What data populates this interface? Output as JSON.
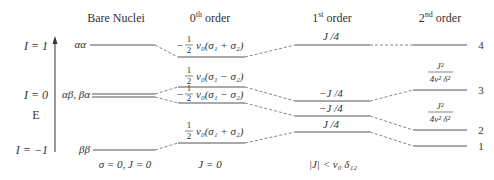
{
  "headers": {
    "bare": "Bare Nuclei",
    "zeroth": "0",
    "zeroth_sup": "th",
    "zeroth_suffix": " order",
    "first": "1",
    "first_sup": "st",
    "first_suffix": " order",
    "second": "2",
    "second_sup": "nd",
    "second_suffix": " order"
  },
  "axis": {
    "label": "E",
    "I_plus": "I = 1",
    "I_zero": "I = 0",
    "I_minus": "I = −1"
  },
  "bare_states": {
    "aa": "αα",
    "ab_ba": "αβ, βα",
    "bb": "ββ"
  },
  "zeroth_terms": {
    "t1_sign": "−",
    "t1_expr": "ν₀(σ₁ + σ₂)",
    "t2_sign": "",
    "t2_expr": "ν₀(σ₁ − σ₂)",
    "t3_sign": "−",
    "t3_expr": "ν₀(σ₁ − σ₂)",
    "t4_sign": "",
    "t4_expr": "ν₀(σ₁ + σ₂)",
    "frac_num": "1",
    "frac_den": "2"
  },
  "first_terms": {
    "t1": "J /4",
    "t2": "−J /4",
    "t3": "−J /4",
    "t4": "J /4"
  },
  "second_terms": {
    "num": "J²",
    "den": "4ν² δ²"
  },
  "level_numbers": [
    "4",
    "3",
    "2",
    "1"
  ],
  "conditions": {
    "bare": "σ = 0, J = 0",
    "zeroth": "J = 0",
    "first": "|J| < ν₀ δ₁₂"
  }
}
